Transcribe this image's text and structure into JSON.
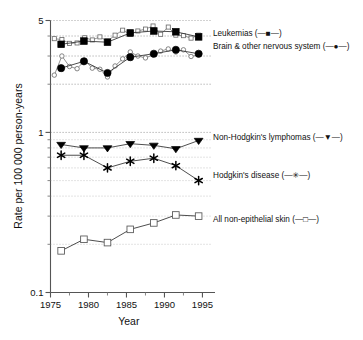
{
  "chart_data": {
    "type": "line",
    "title": "",
    "xlabel": "Year",
    "ylabel": "Rate per 100 000 person-years",
    "yscale": "log",
    "ylim": [
      0.1,
      5
    ],
    "xlim": [
      1975,
      1995.6
    ],
    "ytick_labels": [
      "5",
      "1",
      "0.1"
    ],
    "ytick_values": [
      5,
      1,
      0.1
    ],
    "xtick_labels": [
      "1975",
      "1980",
      "1985",
      "1990",
      "1995"
    ],
    "xtick_values": [
      1975,
      1980,
      1985,
      1990,
      1995
    ],
    "grid": "horizontal-dotted",
    "legend_position": "right",
    "series": [
      {
        "name": "Leukemias",
        "legend_label": "Leukemias (—■—)",
        "marker": "filled-square",
        "x": [
          1976.4,
          1979.4,
          1982.5,
          1985.5,
          1988.6,
          1991.5,
          1994.5
        ],
        "values": [
          3.55,
          3.72,
          3.66,
          4.18,
          4.3,
          4.25,
          3.95
        ],
        "annual_marker": "open-square",
        "annual_x": [
          1975.5,
          1976.5,
          1977.5,
          1978.5,
          1979.5,
          1980.5,
          1981.5,
          1982.5,
          1983.5,
          1984.5,
          1985.5,
          1986.5,
          1987.5,
          1988.5,
          1989.5,
          1990.5,
          1991.5,
          1992.5,
          1993.5,
          1994.5
        ],
        "annual_values": [
          3.85,
          3.8,
          3.6,
          3.62,
          3.9,
          3.78,
          3.95,
          3.72,
          4.05,
          4.35,
          4.1,
          4.3,
          4.42,
          4.62,
          4.1,
          4.55,
          4.05,
          4.02,
          3.88,
          4.05
        ]
      },
      {
        "name": "Brain & other nervous system",
        "legend_label": "Brain & other nervous system (—●—)",
        "marker": "filled-circle",
        "x": [
          1976.4,
          1979.4,
          1982.5,
          1985.5,
          1988.6,
          1991.5,
          1994.5
        ],
        "values": [
          2.52,
          2.78,
          2.35,
          2.95,
          3.1,
          3.28,
          3.1
        ],
        "annual_marker": "open-circle",
        "annual_x": [
          1975.5,
          1976.5,
          1977.5,
          1978.5,
          1979.5,
          1980.5,
          1981.5,
          1982.5,
          1983.5,
          1984.5,
          1985.5,
          1986.5,
          1987.5,
          1988.5,
          1989.5,
          1990.5,
          1991.5,
          1992.5,
          1993.5,
          1994.5
        ],
        "annual_values": [
          2.28,
          3.0,
          2.58,
          2.5,
          2.82,
          2.52,
          2.48,
          2.22,
          2.6,
          2.88,
          3.18,
          3.0,
          2.92,
          3.05,
          3.22,
          3.32,
          3.18,
          3.28,
          2.98,
          3.05
        ]
      },
      {
        "name": "Non-Hodgkin's lymphomas",
        "legend_label": "Non-Hodgkin's lymphomas (—▼—)",
        "marker": "filled-triangle-down",
        "x": [
          1976.4,
          1979.4,
          1982.5,
          1985.5,
          1988.6,
          1991.5,
          1994.5
        ],
        "values": [
          0.84,
          0.8,
          0.8,
          0.85,
          0.83,
          0.79,
          0.89
        ]
      },
      {
        "name": "Hodgkin's disease",
        "legend_label": "Hodgkin's disease (—✳—)",
        "marker": "asterisk",
        "x": [
          1976.4,
          1979.4,
          1982.5,
          1985.5,
          1988.6,
          1991.5,
          1994.5
        ],
        "values": [
          0.72,
          0.72,
          0.6,
          0.66,
          0.69,
          0.62,
          0.5
        ]
      },
      {
        "name": "All non-epithelial skin",
        "legend_label": "All non-epithelial skin (—□—)",
        "marker": "open-square",
        "x": [
          1976.4,
          1979.4,
          1982.5,
          1985.5,
          1988.6,
          1991.5,
          1994.5
        ],
        "values": [
          0.182,
          0.215,
          0.205,
          0.248,
          0.272,
          0.305,
          0.3
        ]
      }
    ]
  },
  "legend": {
    "entries": [
      {
        "label": "Leukemias (—■—)",
        "key": "leukemias"
      },
      {
        "label": "Brain & other nervous system (—●—)",
        "key": "brain"
      },
      {
        "label": "Non-Hodgkin's lymphomas (—▼—)",
        "key": "nhl"
      },
      {
        "label": "Hodgkin's disease (—✳—)",
        "key": "hodgkins"
      },
      {
        "label": "All non-epithelial skin (—□—)",
        "key": "skin"
      }
    ]
  },
  "axes": {
    "y_title": "Rate per 100 000 person-years",
    "x_title": "Year",
    "y_ticks": [
      "5",
      "1",
      "0.1"
    ],
    "x_ticks": [
      "1975",
      "1980",
      "1985",
      "1990",
      "1995"
    ]
  },
  "colors": {
    "foreground": "#000000",
    "axis": "#555555",
    "grid": "#b9b9b9",
    "background": "#ffffff"
  }
}
